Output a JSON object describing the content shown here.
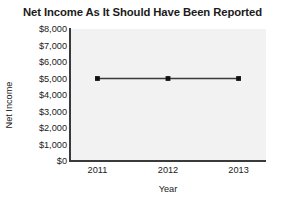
{
  "chart_data": {
    "type": "line",
    "title": "Net Income As It Should Have Been Reported",
    "xlabel": "Year",
    "ylabel": "Net Income",
    "categories": [
      "2011",
      "2012",
      "2013"
    ],
    "x": [
      2011,
      2012,
      2013
    ],
    "values": [
      5000,
      5000,
      5000
    ],
    "series": [
      {
        "name": "Net Income",
        "values": [
          5000,
          5000,
          5000
        ]
      }
    ],
    "ylim": [
      0,
      8000
    ],
    "ytick_values": [
      0,
      1000,
      2000,
      3000,
      4000,
      5000,
      6000,
      7000,
      8000
    ],
    "ytick_labels": [
      "$0",
      "$1,000",
      "$2,000",
      "$3,000",
      "$4,000",
      "$5,000",
      "$6,000",
      "$7,000",
      "$8,000"
    ],
    "xtick_labels": [
      "2011",
      "2012",
      "2013"
    ],
    "grid": false,
    "legend": false,
    "legend_position": "none",
    "colors": {
      "line": "#3a3a3a",
      "marker": "#111111",
      "plot_background": "#f2f2f2",
      "axis": "#3a3a3a",
      "text": "#1b1b1b",
      "figure_background": "#ffffff"
    }
  }
}
